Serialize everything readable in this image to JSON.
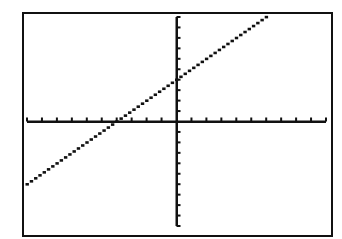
{
  "chart_data": {
    "type": "line",
    "title": "",
    "xlabel": "",
    "ylabel": "",
    "function": "y = x + 4",
    "xlim": [
      -10,
      10
    ],
    "ylim": [
      -10,
      10
    ],
    "x_tick_step": 1,
    "y_tick_step": 1,
    "grid": false,
    "legend": null,
    "series": [
      {
        "name": "Y1",
        "x": [
          -10,
          6
        ],
        "values": [
          -6,
          10
        ]
      }
    ],
    "x_intercept": -4,
    "y_intercept": 4
  },
  "colors": {
    "ink": "#111111",
    "background": "#ffffff"
  }
}
